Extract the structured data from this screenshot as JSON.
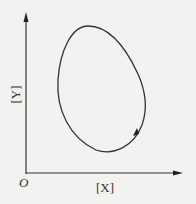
{
  "diagram": {
    "type": "closed-loop phase-space curve",
    "origin_label": "O",
    "x_axis_label": "[X]",
    "y_axis_label": "[Y]",
    "curve": {
      "shape": "egg-shaped closed orbit (limit cycle)",
      "direction": "counterclockwise",
      "stroke_color": "#333333"
    },
    "axis_color": "#333333",
    "background_color": "#f2f2f0"
  }
}
